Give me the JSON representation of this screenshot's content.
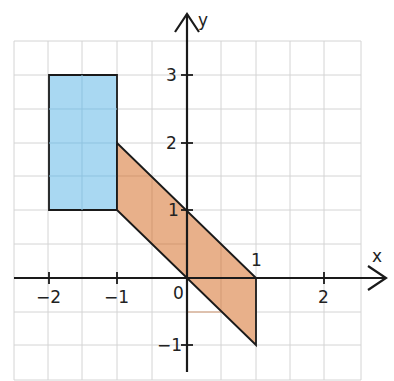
{
  "diagram": {
    "title": "",
    "axes": {
      "x_label": "x",
      "y_label": "y",
      "x_ticks": [
        {
          "value": -2,
          "label": "−2"
        },
        {
          "value": -1,
          "label": "−1"
        },
        {
          "value": 2,
          "label": "2"
        }
      ],
      "y_ticks": [
        {
          "value": 3,
          "label": "3"
        },
        {
          "value": 2,
          "label": "2"
        },
        {
          "value": 1,
          "label": "1"
        },
        {
          "value": -1,
          "label": "−1"
        }
      ],
      "origin_label": "0",
      "point_label": {
        "x": 1,
        "y": 0,
        "label": "1"
      },
      "x_range": [
        -2.5,
        2.5
      ],
      "y_range": [
        -1.5,
        3.5
      ],
      "grid_step": 0.5
    },
    "shapes": [
      {
        "name": "blue-rectangle",
        "type": "rectangle",
        "vertices": [
          [
            -2,
            1
          ],
          [
            -1,
            1
          ],
          [
            -1,
            3
          ],
          [
            -2,
            3
          ]
        ],
        "fill": "#a9d8f2"
      },
      {
        "name": "orange-parallelogram",
        "type": "parallelogram",
        "vertices": [
          [
            -1,
            1
          ],
          [
            -1,
            2
          ],
          [
            1,
            0
          ],
          [
            1,
            -1
          ]
        ],
        "fill": "#e8b08a"
      }
    ],
    "colors": {
      "grid": "#d4d4d4",
      "axis": "#1a1a1a",
      "outline": "#1a1a1a"
    }
  }
}
